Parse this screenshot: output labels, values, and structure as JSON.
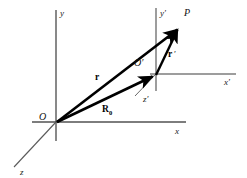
{
  "figure": {
    "background_color": "#ffffff",
    "axis_color": "#7d7d7d",
    "vector_color": "#000000",
    "label_color": "#111111"
  },
  "frames": {
    "unprimed": {
      "origin_label": "O",
      "axes": [
        {
          "name": "x-axis",
          "label": "x"
        },
        {
          "name": "y-axis",
          "label": "y"
        },
        {
          "name": "z-axis",
          "label": "z"
        }
      ]
    },
    "primed": {
      "origin_label": "O′",
      "axes": [
        {
          "name": "x-prime-axis",
          "label": "x′"
        },
        {
          "name": "y-prime-axis",
          "label": "y′"
        },
        {
          "name": "z-prime-axis",
          "label": "z′"
        }
      ]
    }
  },
  "point": {
    "label": "P"
  },
  "vectors": [
    {
      "name": "r",
      "label": "r",
      "subscript": "",
      "from": "O",
      "to": "P"
    },
    {
      "name": "R0",
      "label": "R",
      "subscript": "0",
      "from": "O",
      "to": "O′"
    },
    {
      "name": "r-prime",
      "label": "r",
      "subscript": "",
      "prime": "′",
      "from": "O′",
      "to": "P"
    }
  ],
  "geometry": {
    "origin": {
      "x": 56,
      "y": 122
    },
    "origin_prime": {
      "x": 156,
      "y": 74
    },
    "point_p": {
      "x": 180,
      "y": 26
    },
    "x_axis": {
      "x1": 32,
      "y1": 122,
      "x2": 186,
      "y2": 122
    },
    "y_axis": {
      "x1": 56,
      "y1": 10,
      "x2": 56,
      "y2": 141
    },
    "z_axis": {
      "x1": 56,
      "y1": 122,
      "x2": 14,
      "y2": 167
    },
    "x_prime_axis": {
      "x1": 150,
      "y1": 74,
      "x2": 236,
      "y2": 74
    },
    "y_prime_axis": {
      "x1": 156,
      "y1": 8,
      "x2": 156,
      "y2": 91
    },
    "z_prime_axis": {
      "x1": 156,
      "y1": 74,
      "x2": 135,
      "y2": 96
    },
    "labels": {
      "x": {
        "x": 175,
        "y": 134
      },
      "y": {
        "x": 60,
        "y": 16
      },
      "z": {
        "x": 20,
        "y": 175
      },
      "x_prime": {
        "x": 224,
        "y": 85
      },
      "y_prime": {
        "x": 160,
        "y": 16
      },
      "z_prime": {
        "x": 143,
        "y": 102
      },
      "O": {
        "x": 39,
        "y": 120
      },
      "O_prime": {
        "x": 135,
        "y": 66
      },
      "P": {
        "x": 184,
        "y": 16
      },
      "r": {
        "x": 95,
        "y": 80
      },
      "R0": {
        "x": 103,
        "y": 112
      },
      "r_prime": {
        "x": 168,
        "y": 57
      }
    }
  }
}
